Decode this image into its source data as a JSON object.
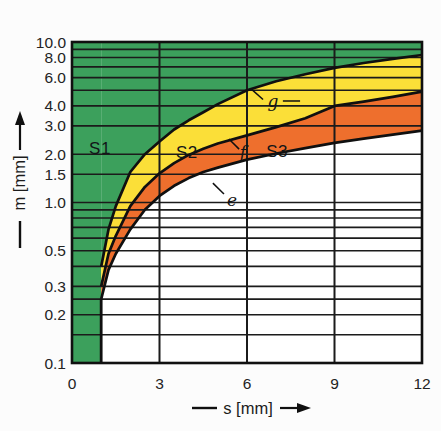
{
  "figure": {
    "background": "#fcfcfc",
    "plot_background": "#ffffff",
    "line_color": "#1b1b1b",
    "curve_color": "#101010"
  },
  "chart_data": {
    "type": "area",
    "title": "",
    "xlabel": "s [mm]",
    "ylabel": "m [mm]",
    "x_axis": {
      "scale": "linear",
      "min": 0,
      "max": 12,
      "tick_labels": [
        "0",
        "3",
        "6",
        "9",
        "12"
      ],
      "tick_values": [
        0,
        3,
        6,
        9,
        12
      ],
      "arrow": "right-arrow-icon",
      "grid_values": [
        3,
        6,
        9
      ]
    },
    "y_axis": {
      "scale": "log",
      "min": 0.1,
      "max": 10,
      "tick_labels": [
        "10.0",
        "8.0",
        "6.0",
        "4.0",
        "3.0",
        "2.0",
        "1.5",
        "1.0",
        "0.5",
        "0.3",
        "0.2",
        "0.1"
      ],
      "tick_values": [
        10,
        8,
        6,
        4,
        3,
        2,
        1.5,
        1,
        0.5,
        0.3,
        0.2,
        0.1
      ],
      "arrow": "up-arrow-icon",
      "grid_values": [
        9,
        8,
        7,
        6,
        5,
        4,
        3,
        2,
        1.5,
        1,
        0.9,
        0.8,
        0.7,
        0.6,
        0.5,
        0.4,
        0.3,
        0.25,
        0.2,
        0.15
      ]
    },
    "grid": true,
    "boundary_vertical_s": 1,
    "curves": [
      {
        "name": "e",
        "points": [
          [
            1,
            0.25
          ],
          [
            1.25,
            0.38
          ],
          [
            1.5,
            0.48
          ],
          [
            2,
            0.68
          ],
          [
            2.5,
            0.9
          ],
          [
            3,
            1.1
          ],
          [
            3.5,
            1.27
          ],
          [
            4,
            1.42
          ],
          [
            4.5,
            1.55
          ],
          [
            5,
            1.65
          ],
          [
            6,
            1.85
          ],
          [
            7,
            2.02
          ],
          [
            8,
            2.18
          ],
          [
            9,
            2.35
          ],
          [
            10,
            2.5
          ],
          [
            11,
            2.65
          ],
          [
            12,
            2.8
          ]
        ]
      },
      {
        "name": "f",
        "points": [
          [
            1,
            0.3
          ],
          [
            1.25,
            0.48
          ],
          [
            1.5,
            0.62
          ],
          [
            2,
            0.95
          ],
          [
            2.5,
            1.25
          ],
          [
            3,
            1.52
          ],
          [
            3.5,
            1.76
          ],
          [
            4,
            1.98
          ],
          [
            4.5,
            2.16
          ],
          [
            5,
            2.33
          ],
          [
            6,
            2.62
          ],
          [
            7,
            2.95
          ],
          [
            8,
            3.35
          ],
          [
            9,
            4.0
          ],
          [
            10,
            4.25
          ],
          [
            11,
            4.55
          ],
          [
            12,
            4.9
          ]
        ]
      },
      {
        "name": "g",
        "points": [
          [
            1,
            0.4
          ],
          [
            1.25,
            0.68
          ],
          [
            1.5,
            0.95
          ],
          [
            2,
            1.55
          ],
          [
            2.5,
            2.0
          ],
          [
            3,
            2.4
          ],
          [
            3.5,
            2.85
          ],
          [
            4,
            3.25
          ],
          [
            4.5,
            3.65
          ],
          [
            5,
            4.1
          ],
          [
            6,
            5.0
          ],
          [
            7,
            5.7
          ],
          [
            8,
            6.3
          ],
          [
            9,
            6.9
          ],
          [
            10,
            7.4
          ],
          [
            11,
            7.85
          ],
          [
            12,
            8.3
          ]
        ]
      }
    ],
    "regions": [
      {
        "name": "S1",
        "color": "#3ca05c",
        "description": "left strip s 0..1 full height plus area above curve g"
      },
      {
        "name": "S2",
        "color": "#fbdf38",
        "description": "between curves f and g"
      },
      {
        "name": "S3",
        "color": "#ee6f2d",
        "description": "between curves e and f"
      }
    ],
    "region_labels": [
      {
        "text": "S1",
        "s": 0.96,
        "m": 2.19
      },
      {
        "text": "S2",
        "s": 3.94,
        "m": 2.06
      },
      {
        "text": "S3",
        "s": 7.03,
        "m": 2.1
      }
    ],
    "curve_labels": [
      {
        "text": "g",
        "s": 6.89,
        "m": 4.29
      },
      {
        "text": "f",
        "s": 5.86,
        "m": 2.07
      },
      {
        "text": "e",
        "s": 5.49,
        "m": 1.04
      }
    ],
    "leaders": [
      {
        "for": "g",
        "pts": [
          [
            6.14,
            5.1
          ],
          [
            6.55,
            4.38
          ]
        ]
      },
      {
        "for": "g",
        "pts": [
          [
            7.23,
            4.29
          ],
          [
            7.82,
            4.29
          ]
        ]
      },
      {
        "for": "f",
        "pts": [
          [
            5.38,
            2.49
          ],
          [
            5.73,
            2.15
          ]
        ]
      },
      {
        "for": "e",
        "pts": [
          [
            4.83,
            1.32
          ],
          [
            5.21,
            1.13
          ]
        ]
      }
    ]
  }
}
